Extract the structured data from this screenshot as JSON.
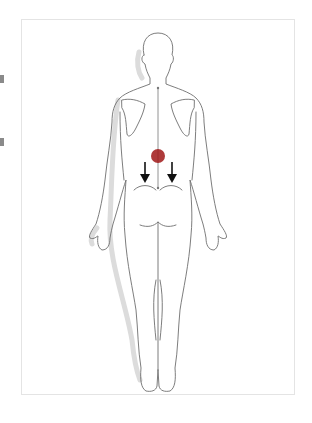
{
  "diagram": {
    "view": "posterior",
    "colors": {
      "outline": "#6a6a6a",
      "shadow": "#d9d9d9",
      "pain_marker": "#a01818",
      "arrow": "#111111",
      "frame": "#e4e4e4"
    },
    "markers": [
      {
        "type": "pain-spot",
        "location": "lumbar spine",
        "x": 158,
        "y": 156
      },
      {
        "type": "arrow-down",
        "location": "left buttock",
        "x": 145,
        "y": 175
      },
      {
        "type": "arrow-down",
        "location": "right buttock",
        "x": 172,
        "y": 175
      }
    ]
  }
}
